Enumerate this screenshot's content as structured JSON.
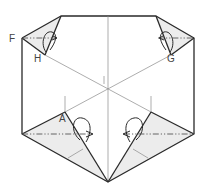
{
  "diagram": {
    "labels": {
      "F": "F",
      "H": "H",
      "G": "G",
      "I": "I",
      "A": "A"
    },
    "fold_types": {
      "horizontal_top": "mountain-fold",
      "horizontal_bottom": "mountain-fold"
    },
    "colors": {
      "line": "#2a2a2a",
      "shade": "#ececec",
      "background": "#ffffff"
    }
  }
}
